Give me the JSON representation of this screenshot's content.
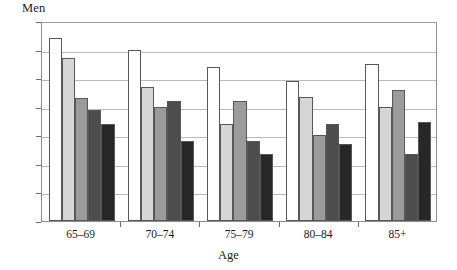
{
  "chart_data": {
    "type": "bar",
    "title": "",
    "xlabel": "Age",
    "ylabel": "Men",
    "categories": [
      "65–69",
      "70–74",
      "75–79",
      "80–84",
      "85+"
    ],
    "ylim": [
      0,
      70
    ],
    "yticks": [
      0,
      10,
      20,
      30,
      40,
      50,
      60,
      70
    ],
    "ytick_labels": [
      "0",
      "10",
      "20",
      "30",
      "40",
      "50",
      "60",
      "70"
    ],
    "grid": true,
    "legend": "none",
    "series": [
      {
        "name": "series-1",
        "color": "#ffffff",
        "values": [
          64,
          60,
          54,
          49,
          55
        ]
      },
      {
        "name": "series-2",
        "color": "#d6d6d6",
        "values": [
          57,
          47,
          34,
          43.5,
          40
        ]
      },
      {
        "name": "series-3",
        "color": "#9b9b9b",
        "values": [
          43,
          40,
          42,
          30,
          46
        ]
      },
      {
        "name": "series-4",
        "color": "#4d4d4d",
        "values": [
          39,
          42,
          28,
          34,
          23.5
        ]
      },
      {
        "name": "series-5",
        "color": "#272727",
        "values": [
          34,
          28,
          23.5,
          27,
          34.5
        ]
      }
    ]
  }
}
